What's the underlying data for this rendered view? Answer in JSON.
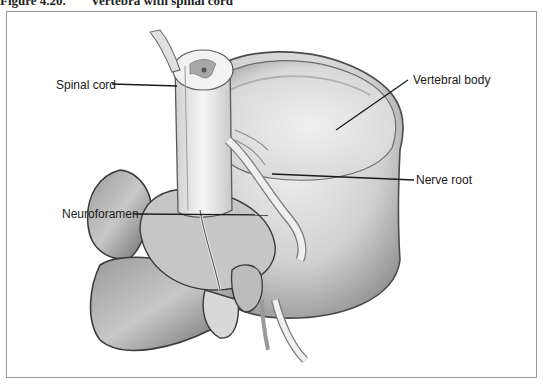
{
  "figure": {
    "number": "Figure 4.20.",
    "title": "Vertebra with spinal cord"
  },
  "labels": {
    "spinal_cord": "Spinal cord",
    "vertebral_body": "Vertebral body",
    "nerve_root": "Nerve root",
    "neuroforamen": "Neuroforamen"
  },
  "colors": {
    "frame_border": "#9a9a9a",
    "leader_line": "#1a1a1a",
    "bone_dark": "#5a5a5a",
    "bone_mid": "#a8a8a8",
    "bone_light": "#e6e6e6"
  }
}
